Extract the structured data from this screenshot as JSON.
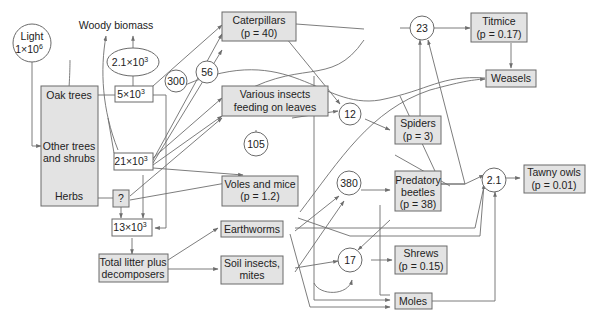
{
  "colors": {
    "box_fill": "#e3e3e3",
    "stroke": "#6a6a6a",
    "text": "#222222",
    "background": "#ffffff"
  },
  "nodes": {
    "light": {
      "line1": "Light",
      "line2": "1×10",
      "exp": "6"
    },
    "woody_biomass": "Woody biomass",
    "woody_value": {
      "base": "2.1×10",
      "exp": "3"
    },
    "oak_trees": "Oak trees",
    "other_trees": {
      "line1": "Other trees",
      "line2": "and shrubs"
    },
    "herbs": "Herbs",
    "oak_value": {
      "base": "5×10",
      "exp": "3"
    },
    "other_value": {
      "base": "21×10",
      "exp": "3"
    },
    "herbs_value": "?",
    "litter_value": {
      "base": "13×10",
      "exp": "3"
    },
    "total_litter": {
      "line1": "Total litter plus",
      "line2": "decomposers"
    },
    "caterpillars": {
      "line1": "Caterpillars",
      "line2": "(p = 40)"
    },
    "various_insects": {
      "line1": "Various insects",
      "line2": "feeding on leaves"
    },
    "voles_mice": {
      "line1": "Voles and mice",
      "line2": "(p = 1.2)"
    },
    "earthworms": "Earthworms",
    "soil_insects": {
      "line1": "Soil insects,",
      "line2": "mites"
    },
    "spiders": {
      "line1": "Spiders",
      "line2": "(p = 3)"
    },
    "predatory_beetles": {
      "line1": "Predatory",
      "line2": "beetles",
      "line3": "(p = 38)"
    },
    "shrews": {
      "line1": "Shrews",
      "line2": "(p = 0.15)"
    },
    "moles": "Moles",
    "titmice": {
      "line1": "Titmice",
      "line2": "(p = 0.17)"
    },
    "weasels": "Weasels",
    "tawny_owls": {
      "line1": "Tawny owls",
      "line2": "(p = 0.01)"
    }
  },
  "flows": {
    "c300": "300",
    "c56": "56",
    "c23": "23",
    "c12": "12",
    "c105": "105",
    "c380": "380",
    "c17": "17",
    "c2_1": "2.1"
  }
}
